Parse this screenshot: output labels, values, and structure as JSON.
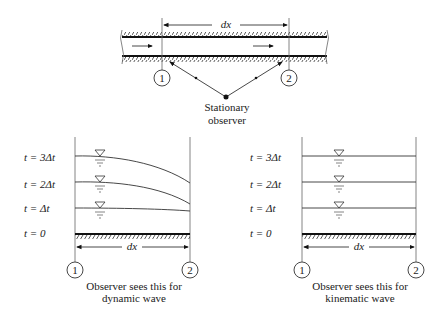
{
  "top": {
    "dx_label": "dx",
    "section_1": "1",
    "section_2": "2",
    "observer_line1": "Stationary",
    "observer_line2": "observer"
  },
  "dynamic_panel": {
    "time_labels": [
      "t = 3Δt",
      "t = 2Δt",
      "t = Δt",
      "t = 0"
    ],
    "dx_label": "dx",
    "section_1": "1",
    "section_2": "2",
    "caption_line1": "Observer sees this for",
    "caption_line2": "dynamic wave"
  },
  "kinematic_panel": {
    "time_labels": [
      "t = 3Δt",
      "t = 2Δt",
      "t = Δt",
      "t = 0"
    ],
    "dx_label": "dx",
    "section_1": "1",
    "section_2": "2",
    "caption_line1": "Observer sees this for",
    "caption_line2": "kinematic wave"
  }
}
